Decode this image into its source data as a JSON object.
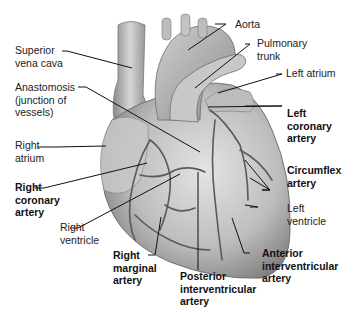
{
  "diagram": {
    "labels": {
      "aorta": [
        "Aorta"
      ],
      "superior_vena_cava": [
        "Superior",
        "vena cava"
      ],
      "pulmonary_trunk": [
        "Pulmonary",
        "trunk"
      ],
      "left_atrium": [
        "Left atrium"
      ],
      "anastomosis": [
        "Anastomosis",
        "(junction of",
        "vessels)"
      ],
      "left_coronary_artery": [
        "Left",
        "coronary",
        "artery"
      ],
      "right_atrium": [
        "Right",
        "atrium"
      ],
      "circumflex_artery": [
        "Circumflex",
        "artery"
      ],
      "right_coronary_artery": [
        "Right",
        "coronary",
        "artery"
      ],
      "left_ventricle": [
        "Left",
        "ventricle"
      ],
      "right_ventricle": [
        "Right",
        "ventricle"
      ],
      "right_marginal_artery": [
        "Right",
        "marginal",
        "artery"
      ],
      "anterior_interventricular_artery": [
        "Anterior",
        "interventricular",
        "artery"
      ],
      "posterior_interventricular_artery": [
        "Posterior",
        "interventricular",
        "artery"
      ]
    },
    "colors": {
      "heart_light": "#d9d9d9",
      "heart_mid": "#a8a8a8",
      "heart_dark": "#6e6e6e",
      "vessel": "#555555",
      "leader_line": "#111111"
    }
  }
}
